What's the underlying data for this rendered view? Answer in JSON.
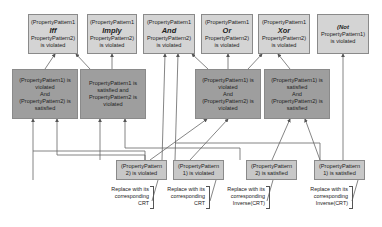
{
  "top_row": [
    {
      "line1": "(PropertyPattern1",
      "op": "Iff",
      "line3": "PropertyPattern2)",
      "line4": "is violated"
    },
    {
      "line1": "(PropertyPattern1",
      "op": "Imply",
      "line3": "PropertyPattern2)",
      "line4": "is violated"
    },
    {
      "line1": "(PropertyPattern1",
      "op": "And",
      "line3": "PropertyPattern2)",
      "line4": "is violated"
    },
    {
      "line1": "(PropertyPattern1",
      "op": "Or",
      "line3": "PropertyPattern2)",
      "line4": "is violated"
    },
    {
      "line1": "(PropertyPattern1",
      "op": "Xor",
      "line3": "PropertyPattern2)",
      "line4": "is violated"
    },
    {
      "line1": "(Not",
      "op": "",
      "line3": "PropertyPattern1)",
      "line4": "is violated"
    }
  ],
  "middle_row": [
    {
      "l1": "(PropertyPattern1) is",
      "l2": "violated",
      "l3": "And",
      "l4": "(PropertyPattern2) is",
      "l5": "satisfied"
    },
    {
      "l1": "PropertyPattern1 is",
      "l2": "satisfied and",
      "l3": "PropertyPattern2 is",
      "l4": "violated",
      "l5": ""
    },
    {
      "l1": "(PropertyPattern1) is",
      "l2": "violated",
      "l3": "And",
      "l4": "(PropertyPattern2) is",
      "l5": "violated"
    },
    {
      "l1": "(PropertyPattern1) is",
      "l2": "satisfied",
      "l3": "And",
      "l4": "(PropertyPattern2) is",
      "l5": "satisfied"
    }
  ],
  "bottom_row": [
    {
      "l1": "(PropertyPattern",
      "l2": "2) is violated"
    },
    {
      "l1": "(PropertyPattern",
      "l2": "1) is violated"
    },
    {
      "l1": "(PropertyPattern",
      "l2": "2) is satisfied"
    },
    {
      "l1": "(PropertyPattern",
      "l2": "1) is satisfied"
    }
  ],
  "notes": [
    {
      "l1": "Replace with its",
      "l2": "corresponding",
      "l3": "CRT"
    },
    {
      "l1": "Replace with its",
      "l2": "corresponding",
      "l3": "CRT"
    },
    {
      "l1": "Replace with its",
      "l2": "corresponding",
      "l3": "Inverse(CRT)"
    },
    {
      "l1": "Replace with its",
      "l2": "corresponding",
      "l3": "Inverse(CRT)"
    }
  ]
}
